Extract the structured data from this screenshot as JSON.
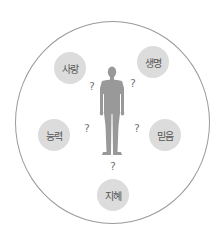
{
  "diagram": {
    "center": {
      "label": "person-silhouette",
      "color": "#999999"
    },
    "nodes": [
      {
        "label": "사랑",
        "x": 70,
        "y": 68
      },
      {
        "label": "생명",
        "x": 153,
        "y": 62
      },
      {
        "label": "능력",
        "x": 54,
        "y": 135
      },
      {
        "label": "믿음",
        "x": 165,
        "y": 135
      },
      {
        "label": "지혜",
        "x": 113,
        "y": 195
      }
    ],
    "question_marks": [
      {
        "text": "?",
        "x": 92,
        "y": 86
      },
      {
        "text": "?",
        "x": 133,
        "y": 83
      },
      {
        "text": "?",
        "x": 87,
        "y": 128
      },
      {
        "text": "?",
        "x": 137,
        "y": 128
      },
      {
        "text": "?",
        "x": 113,
        "y": 166
      }
    ],
    "colors": {
      "node_fill": "#dcdcdc",
      "outline": "#9a9a9a",
      "figure": "#999999",
      "text": "#555555"
    }
  }
}
